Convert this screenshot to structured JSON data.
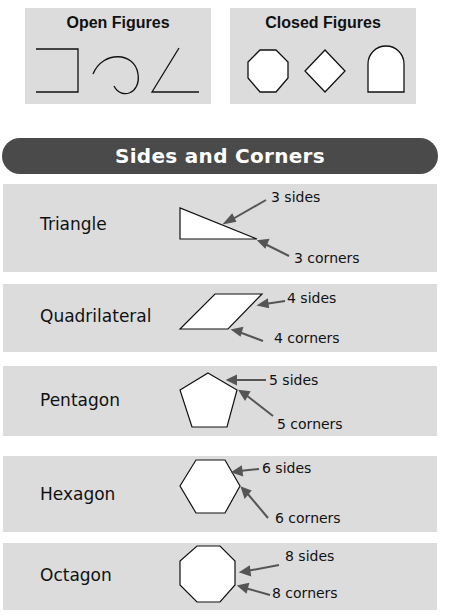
{
  "open_figures": {
    "title": "Open Figures",
    "shapes": [
      "open-square-bracket",
      "open-curve",
      "open-angle"
    ]
  },
  "closed_figures": {
    "title": "Closed Figures",
    "shapes": [
      "octagon",
      "diamond",
      "arch"
    ]
  },
  "banner": {
    "title": "Sides and Corners"
  },
  "rows": [
    {
      "name": "Triangle",
      "sides_label": "3 sides",
      "corners_label": "3 corners"
    },
    {
      "name": "Quadrilateral",
      "sides_label": "4 sides",
      "corners_label": "4 corners"
    },
    {
      "name": "Pentagon",
      "sides_label": "5 sides",
      "corners_label": "5 corners"
    },
    {
      "name": "Hexagon",
      "sides_label": "6 sides",
      "corners_label": "6 corners"
    },
    {
      "name": "Octagon",
      "sides_label": "8 sides",
      "corners_label": "8 corners"
    }
  ],
  "colors": {
    "panel_bg": "#dcdcdc",
    "banner_bg": "#4a4a4a",
    "banner_text": "#ffffff",
    "arrow": "#555555"
  }
}
